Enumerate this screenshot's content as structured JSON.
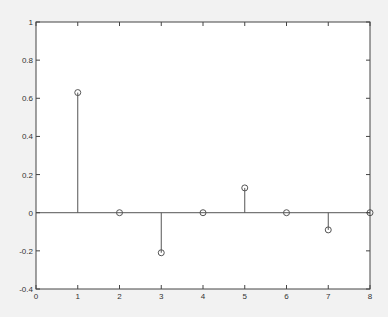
{
  "chart_data": {
    "type": "stem",
    "title": "",
    "xlabel": "",
    "ylabel": "",
    "xlim": [
      0,
      8
    ],
    "ylim": [
      -0.4,
      1
    ],
    "grid": false,
    "legend": null,
    "x_ticks": [
      "0",
      "1",
      "2",
      "3",
      "4",
      "5",
      "6",
      "7",
      "8"
    ],
    "y_ticks": [
      "-0.4",
      "-0.2",
      "0",
      "0.2",
      "0.4",
      "0.6",
      "0.8",
      "1"
    ],
    "x": [
      1,
      2,
      3,
      4,
      5,
      6,
      7,
      8
    ],
    "values": [
      0.63,
      0,
      -0.21,
      0,
      0.13,
      0,
      -0.09,
      0
    ],
    "baseline": 0,
    "marker": "circle-open",
    "colors": {
      "line": "#555555",
      "axes": "#444444",
      "background": "#ffffff",
      "figure": "#f2f2f2"
    }
  }
}
